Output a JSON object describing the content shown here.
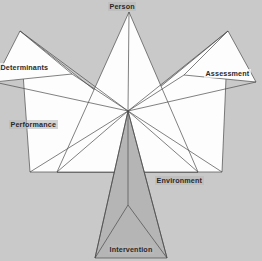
{
  "diagram": {
    "background_color": "#c9c9c9",
    "stroke_color": "#4a4a4a",
    "fill_white": "#fdfdfd",
    "fill_gray": "#b5b5b5",
    "center_point": {
      "x": 128,
      "y": 111
    },
    "labels": {
      "person": "Person",
      "determinants": "Determinants",
      "assessment": "Assessment",
      "performance": "Performance",
      "environment": "Environment",
      "intervention": "Intervention"
    },
    "nodes": [
      {
        "key": "person",
        "label": "Person",
        "position": "top",
        "fill": "#fdfdfd",
        "apex": {
          "x": 129,
          "y": 12
        }
      },
      {
        "key": "determinants",
        "label": "Determinants",
        "position": "upper-left",
        "fill": "#fdfdfd",
        "apex": {
          "x": 20,
          "y": 31
        }
      },
      {
        "key": "assessment",
        "label": "Assessment",
        "position": "upper-right",
        "fill": "#fdfdfd",
        "apex": {
          "x": 228,
          "y": 31
        }
      },
      {
        "key": "performance",
        "label": "Performance",
        "position": "left",
        "fill": "#fdfdfd",
        "apex": {
          "x": 30,
          "y": 172
        }
      },
      {
        "key": "environment",
        "label": "Environment",
        "position": "right",
        "fill": "#fdfdfd",
        "apex": {
          "x": 222,
          "y": 172
        }
      },
      {
        "key": "intervention",
        "label": "Intervention",
        "position": "bottom",
        "fill": "#b5b5b5",
        "apex": {
          "x": 128,
          "y": 258
        }
      }
    ]
  }
}
